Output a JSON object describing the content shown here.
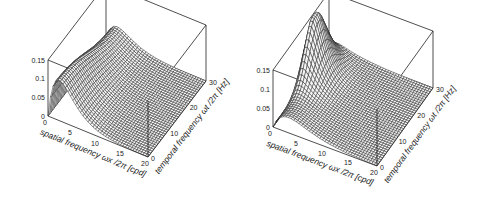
{
  "figure": {
    "panels": [
      {
        "id": "left",
        "z_ticks": [
          "0.15",
          "0.1",
          "0.05",
          "0"
        ],
        "x_ticks": [
          "0",
          "5",
          "10",
          "15",
          "20"
        ],
        "t_ticks": [
          "0",
          "10",
          "20",
          "30"
        ],
        "x_label": "spatial frequency ωx /2π [cpd]",
        "t_label": "temporal frequency ωt /2π [Hz]"
      },
      {
        "id": "right",
        "z_ticks": [
          "0.15",
          "0.1",
          "0.05",
          "0"
        ],
        "x_ticks": [
          "0",
          "5",
          "10",
          "15",
          "20"
        ],
        "t_ticks": [
          "0",
          "10",
          "20",
          "30"
        ],
        "x_label": "spatial frequency ωx /2π [cpd]",
        "t_label": "temporal frequency ωt /2π [Hz]"
      }
    ]
  },
  "chart_data": [
    {
      "type": "surface",
      "title": "",
      "xlabel": "spatial frequency ωx/2π [cpd]",
      "ylabel": "temporal frequency ωt/2π [Hz]",
      "zlabel": "",
      "xlim": [
        0,
        20
      ],
      "ylim": [
        0,
        30
      ],
      "zlim": [
        0,
        0.15
      ],
      "x_ticks": [
        0,
        5,
        10,
        15,
        20
      ],
      "y_ticks": [
        0,
        10,
        20,
        30
      ],
      "z_ticks": [
        0,
        0.05,
        0.1,
        0.15
      ],
      "description": "Spatiotemporal sensitivity surface; peak ~0.11 at low spatial frequency (~2 cpd) and low temporal frequency, decaying toward high spatial and temporal frequencies.",
      "peak": {
        "x": 2,
        "y": 0,
        "z": 0.11
      }
    },
    {
      "type": "surface",
      "title": "",
      "xlabel": "spatial frequency ωx/2π [cpd]",
      "ylabel": "temporal frequency ωt/2π [Hz]",
      "zlabel": "",
      "xlim": [
        0,
        20
      ],
      "ylim": [
        0,
        30
      ],
      "zlim": [
        0,
        0.15
      ],
      "x_ticks": [
        0,
        5,
        10,
        15,
        20
      ],
      "y_ticks": [
        0,
        10,
        20,
        30
      ],
      "z_ticks": [
        0,
        0.05,
        0.1,
        0.15
      ],
      "description": "Spatiotemporal sensitivity surface; ridge along low spatial frequency rising with temporal frequency, peak ~0.17 near spatial ~1 cpd and temporal ~20 Hz, low elsewhere.",
      "peak": {
        "x": 1,
        "y": 20,
        "z": 0.17
      }
    }
  ]
}
